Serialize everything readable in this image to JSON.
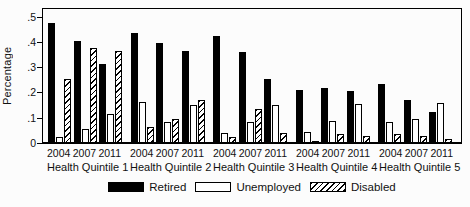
{
  "figure": {
    "ylabel": "Percentage",
    "background": "#fcfcfc",
    "axis_color": "#000000"
  },
  "y_ticks": [
    {
      "label": ".5",
      "value": 0.5
    },
    {
      "label": ".4",
      "value": 0.4
    },
    {
      "label": ".3",
      "value": 0.3
    },
    {
      "label": ".2",
      "value": 0.2
    },
    {
      "label": ".1",
      "value": 0.1
    },
    {
      "label": "0",
      "value": 0.0
    }
  ],
  "legend": [
    {
      "label": "Retired",
      "style": "solid",
      "fill": "#000000"
    },
    {
      "label": "Unemployed",
      "style": "open",
      "fill": "#ffffff"
    },
    {
      "label": "Disabled",
      "style": "hatched",
      "fill": "diagonal-hatch"
    }
  ],
  "chart_data": {
    "type": "bar",
    "title": "",
    "xlabel": "",
    "ylabel": "Percentage",
    "ylim": [
      0,
      0.53
    ],
    "grid": false,
    "legend_position": "bottom-center",
    "year_categories": [
      "2004",
      "2007",
      "2011"
    ],
    "series_names": [
      "Retired",
      "Unemployed",
      "Disabled"
    ],
    "quintiles": [
      {
        "label": "Health Quintile 1",
        "years": [
          {
            "year": "2004",
            "values": {
              "Retired": 0.47,
              "Unemployed": 0.02,
              "Disabled": 0.25
            }
          },
          {
            "year": "2007",
            "values": {
              "Retired": 0.4,
              "Unemployed": 0.05,
              "Disabled": 0.37
            }
          },
          {
            "year": "2011",
            "values": {
              "Retired": 0.31,
              "Unemployed": 0.11,
              "Disabled": 0.36
            }
          }
        ]
      },
      {
        "label": "Health Quintile 2",
        "years": [
          {
            "year": "2004",
            "values": {
              "Retired": 0.43,
              "Unemployed": 0.16,
              "Disabled": 0.06
            }
          },
          {
            "year": "2007",
            "values": {
              "Retired": 0.39,
              "Unemployed": 0.08,
              "Disabled": 0.09
            }
          },
          {
            "year": "2011",
            "values": {
              "Retired": 0.36,
              "Unemployed": 0.145,
              "Disabled": 0.165
            }
          }
        ]
      },
      {
        "label": "Health Quintile 3",
        "years": [
          {
            "year": "2004",
            "values": {
              "Retired": 0.42,
              "Unemployed": 0.035,
              "Disabled": 0.02
            }
          },
          {
            "year": "2007",
            "values": {
              "Retired": 0.355,
              "Unemployed": 0.08,
              "Disabled": 0.13
            }
          },
          {
            "year": "2011",
            "values": {
              "Retired": 0.25,
              "Unemployed": 0.145,
              "Disabled": 0.035
            }
          }
        ]
      },
      {
        "label": "Health Quintile 4",
        "years": [
          {
            "year": "2004",
            "values": {
              "Retired": 0.205,
              "Unemployed": 0.04,
              "Disabled": 0.005
            }
          },
          {
            "year": "2007",
            "values": {
              "Retired": 0.215,
              "Unemployed": 0.085,
              "Disabled": 0.03
            }
          },
          {
            "year": "2011",
            "values": {
              "Retired": 0.2,
              "Unemployed": 0.15,
              "Disabled": 0.025
            }
          }
        ]
      },
      {
        "label": "Health Quintile 5",
        "years": [
          {
            "year": "2004",
            "values": {
              "Retired": 0.23,
              "Unemployed": 0.08,
              "Disabled": 0.03
            }
          },
          {
            "year": "2007",
            "values": {
              "Retired": 0.165,
              "Unemployed": 0.09,
              "Disabled": 0.025
            }
          },
          {
            "year": "2011",
            "values": {
              "Retired": 0.12,
              "Unemployed": 0.155,
              "Disabled": 0.01
            }
          }
        ]
      }
    ]
  }
}
